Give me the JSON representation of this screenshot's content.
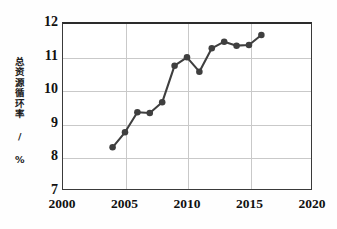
{
  "chart_data": {
    "type": "line",
    "title": "",
    "xlabel": "",
    "ylabel": "总资源循环率 / %",
    "xlim": [
      2000,
      2020
    ],
    "ylim": [
      7,
      12
    ],
    "xticks": [
      "2000",
      "2005",
      "2010",
      "2015",
      "2020"
    ],
    "yticks": [
      "12",
      "11",
      "10",
      "9",
      "8",
      "7"
    ],
    "grid": true,
    "legend": "none",
    "marker": "filled-circle",
    "line_color": "#3f3f3f",
    "marker_color": "#3f3f3f",
    "x": [
      2004,
      2005,
      2006,
      2007,
      2008,
      2009,
      2010,
      2011,
      2012,
      2013,
      2014,
      2015,
      2016
    ],
    "values": [
      8.3,
      8.75,
      9.35,
      9.33,
      9.65,
      10.75,
      11.0,
      10.57,
      11.27,
      11.47,
      11.35,
      11.37,
      11.67
    ],
    "series": [
      {
        "name": "总资源循环率",
        "values": [
          8.3,
          8.75,
          9.35,
          9.33,
          9.65,
          10.75,
          11.0,
          10.57,
          11.27,
          11.47,
          11.35,
          11.37,
          11.67
        ]
      }
    ]
  },
  "axes": {
    "y_caption": "总资源循环率 / %",
    "x_tick_labels": [
      "2000",
      "2005",
      "2010",
      "2015",
      "2020"
    ],
    "y_tick_labels": [
      "12",
      "11",
      "10",
      "9",
      "8",
      "7"
    ]
  }
}
